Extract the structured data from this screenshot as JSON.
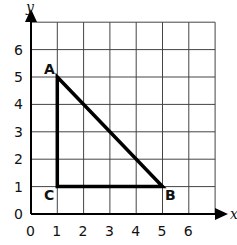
{
  "diagram": {
    "type": "coordinate-grid",
    "x_axis_label": "x",
    "y_axis_label": "y",
    "x_ticks": [
      "0",
      "1",
      "2",
      "3",
      "4",
      "5",
      "6"
    ],
    "y_ticks": [
      "0",
      "1",
      "2",
      "3",
      "4",
      "5",
      "6"
    ],
    "grid_size": 7,
    "points": [
      {
        "name": "A",
        "x": 1,
        "y": 5
      },
      {
        "name": "B",
        "x": 5,
        "y": 1
      },
      {
        "name": "C",
        "x": 1,
        "y": 1
      }
    ],
    "shape": "right triangle ABC"
  }
}
